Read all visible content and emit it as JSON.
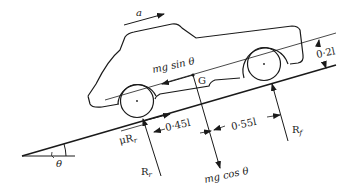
{
  "diagram": {
    "colors": {
      "ink": "#1a1a1a",
      "background": "#ffffff"
    },
    "labels": {
      "acceleration": "a",
      "weight_component_parallel": "mg sin θ",
      "center_of_gravity": "G",
      "height_of_G": "0·2l",
      "friction_rear": "μR",
      "friction_rear_sub": "r",
      "rear_to_G": "0·45l",
      "G_to_front": "0·55l",
      "reaction_rear": "R",
      "reaction_rear_sub": "r",
      "reaction_front": "R",
      "reaction_front_sub": "f",
      "weight_component_normal": "mg cos θ",
      "incline_angle": "θ"
    }
  }
}
